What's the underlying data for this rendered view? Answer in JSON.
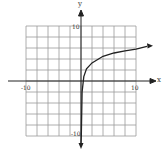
{
  "chart_data": {
    "type": "line",
    "title": "",
    "xlabel": "x",
    "ylabel": "y",
    "xlim": [
      -10,
      10
    ],
    "ylim": [
      -10,
      10
    ],
    "grid": true,
    "grid_step": 2,
    "tick_labels": {
      "x": [
        "-10",
        "10"
      ],
      "y": [
        "10",
        "-10"
      ]
    },
    "series": [
      {
        "name": "logarithmic curve",
        "description": "increasing logarithmic-shaped curve with vertical asymptote at x = 0, arrow heads at both ends",
        "x": [
          0.05,
          0.2,
          0.5,
          1,
          2,
          4,
          6,
          8,
          10,
          12
        ],
        "y": [
          -10,
          -2,
          0.8,
          2.2,
          3.3,
          4.5,
          5.1,
          5.5,
          5.8,
          6.3
        ]
      }
    ],
    "colors": {
      "grid": "#888888",
      "axes": "#222222",
      "curve": "#222222"
    }
  },
  "labels": {
    "x_axis": "x",
    "y_axis": "y",
    "x_min": "-10",
    "x_max": "10",
    "y_max": "10",
    "y_min": "-10"
  }
}
